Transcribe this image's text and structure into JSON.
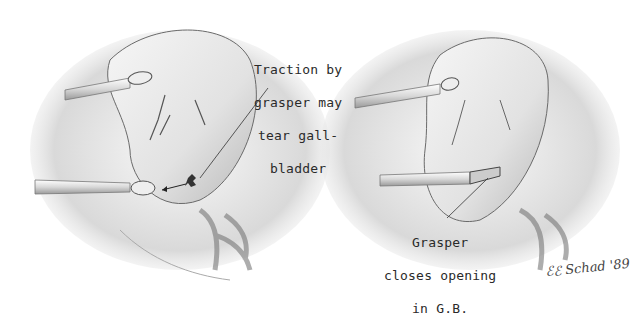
{
  "figure": {
    "panels": [
      {
        "id": "left",
        "annotation": {
          "lines": [
            "Traction by",
            "grasper may",
            "tear gall-",
            "bladder"
          ]
        }
      },
      {
        "id": "right",
        "annotation": {
          "lines": [
            "Grasper",
            "closes opening",
            "in G.B."
          ]
        }
      }
    ],
    "signature": "ℰℰ Schad '89"
  },
  "colors": {
    "background": "#ffffff",
    "pencil_dark": "#3a3a3a",
    "pencil_mid": "#8a8a8a",
    "pencil_light": "#cfcfcf",
    "tissue_highlight": "#f2f2f2"
  }
}
